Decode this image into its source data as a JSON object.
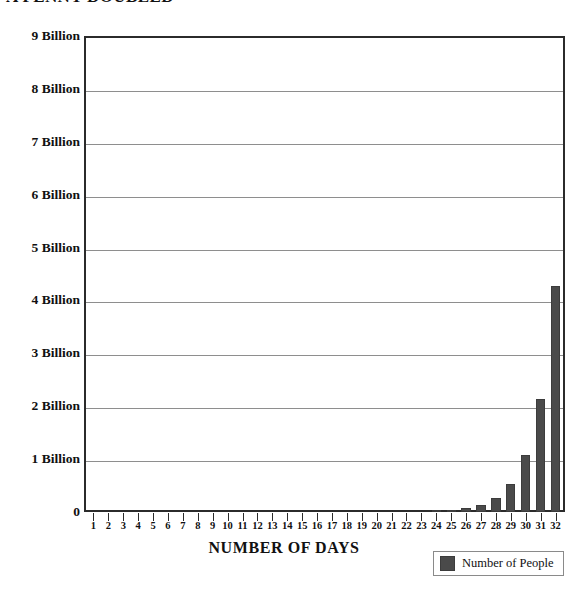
{
  "top_heading": "A PENNY DOUBLED",
  "chart_data": {
    "type": "bar",
    "title": "",
    "xlabel": "NUMBER OF DAYS",
    "ylabel": "",
    "legend": [
      {
        "name": "Number of People",
        "color": "#4a4a4a"
      }
    ],
    "legend_position": "bottom-right",
    "grid": true,
    "ylim": [
      0,
      9000000000
    ],
    "y_ticks": [
      0,
      1000000000,
      2000000000,
      3000000000,
      4000000000,
      5000000000,
      6000000000,
      7000000000,
      8000000000,
      9000000000
    ],
    "y_tick_labels": [
      "0",
      "1 Billion",
      "2 Billion",
      "3 Billion",
      "4 Billion",
      "5 Billion",
      "6 Billion",
      "7 Billion",
      "8 Billion",
      "9 Billion"
    ],
    "categories": [
      "1",
      "2",
      "3",
      "4",
      "5",
      "6",
      "7",
      "8",
      "9",
      "10",
      "11",
      "12",
      "13",
      "14",
      "15",
      "16",
      "17",
      "18",
      "19",
      "20",
      "21",
      "22",
      "23",
      "24",
      "25",
      "26",
      "27",
      "28",
      "29",
      "30",
      "31",
      "32"
    ],
    "values": [
      2,
      4,
      8,
      16,
      32,
      64,
      128,
      256,
      512,
      1024,
      2048,
      4096,
      8192,
      16384,
      32768,
      65536,
      131072,
      262144,
      524288,
      1048576,
      2097152,
      4194304,
      8388608,
      16777216,
      33554432,
      67108864,
      134217728,
      268435456,
      536870912,
      1073741824,
      2147483648,
      4294967296
    ],
    "display_values_billions": [
      0,
      0,
      0,
      0,
      0,
      0,
      0,
      0,
      0,
      0,
      0,
      0,
      0,
      0,
      0,
      0,
      0,
      0,
      0,
      0,
      0,
      0,
      0.03,
      0.07,
      0.13,
      0.27,
      0.54,
      1.07,
      2.15,
      4.29,
      8.59,
      8.59
    ],
    "bar_color": "#4a4a4a",
    "axis_color": "#2b2b2b",
    "gridline_color": "#8e8e8e",
    "background": "#ffffff"
  }
}
